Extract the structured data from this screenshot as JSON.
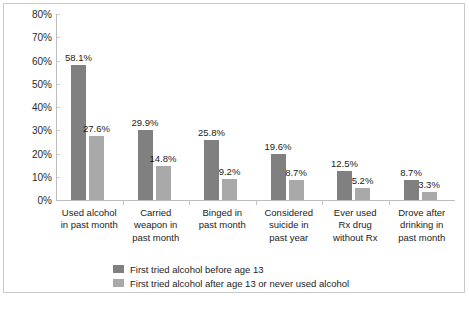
{
  "chart_data": {
    "type": "bar",
    "title": "",
    "subtitle": "",
    "xlabel": "",
    "ylabel": "",
    "ylim": [
      0,
      80
    ],
    "ytick_labels": [
      "80%",
      "70%",
      "60%",
      "50%",
      "40%",
      "30%",
      "20%",
      "10%",
      "0%"
    ],
    "ytick_values": [
      80,
      70,
      60,
      50,
      40,
      30,
      20,
      10,
      0
    ],
    "grid": false,
    "legend_position": "bottom-left",
    "categories": [
      "Used alcohol in past month",
      "Carried weapon in past month",
      "Binged in past month",
      "Considered suicide in past year",
      "Ever used Rx drug without Rx",
      "Drove after drinking in past month"
    ],
    "category_lines": [
      [
        "Used alcohol",
        "in past month"
      ],
      [
        "Carried",
        "weapon in",
        "past month"
      ],
      [
        "Binged in",
        "past month"
      ],
      [
        "Considered",
        "suicide in",
        "past year"
      ],
      [
        "Ever used",
        "Rx drug",
        "without Rx"
      ],
      [
        "Drove after",
        "drinking in",
        "past month"
      ]
    ],
    "series": [
      {
        "name": "First tried alcohol before age 13",
        "color": "#808080",
        "values": [
          58.1,
          29.9,
          25.8,
          19.6,
          12.5,
          8.7
        ],
        "labels": [
          "58.1%",
          "29.9%",
          "25.8%",
          "19.6%",
          "12.5%",
          "8.7%"
        ]
      },
      {
        "name": "First tried alcohol after age 13 or never used alcohol",
        "color": "#a9a9a9",
        "values": [
          27.6,
          14.8,
          9.2,
          8.7,
          5.2,
          3.3
        ],
        "labels": [
          "27.6%",
          "14.8%",
          "9.2%",
          "8.7%",
          "5.2%",
          "3.3%"
        ]
      }
    ]
  },
  "legend": {
    "items": [
      {
        "label": "First tried alcohol before age 13",
        "color": "#808080"
      },
      {
        "label": "First tried alcohol after age 13 or never used alcohol",
        "color": "#a9a9a9"
      }
    ]
  }
}
